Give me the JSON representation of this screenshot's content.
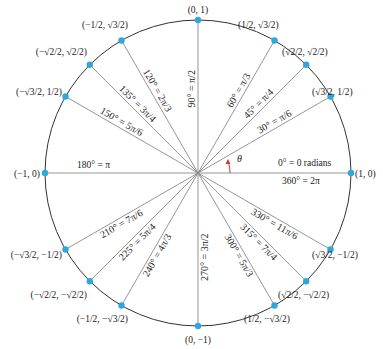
{
  "diagram": {
    "colors": {
      "point": "#2ea8dc",
      "theta_arrow": "#e0303a",
      "circle": "#333333",
      "rays": "#8a8a8a"
    },
    "center": [
      198,
      173
    ],
    "radius": 153,
    "theta_label": "θ",
    "axis_labels": {
      "right_top": "0° = 0 radians",
      "right_bottom": "360° = 2π",
      "left": "180° = π",
      "top": "90° = π/2",
      "bottom": "270° = 3π/2"
    },
    "angles": [
      {
        "deg": 0,
        "label": "",
        "coord": "(1, 0)"
      },
      {
        "deg": 30,
        "label": "30° = π/6",
        "coord": "(√3/2, 1/2)"
      },
      {
        "deg": 45,
        "label": "45° = π/4",
        "coord": "(√2/2, √2/2)"
      },
      {
        "deg": 60,
        "label": "60° = π/3",
        "coord": "(1/2, √3/2)"
      },
      {
        "deg": 90,
        "label": "90° = π/2",
        "coord": "(0, 1)"
      },
      {
        "deg": 120,
        "label": "120° = 2π/3",
        "coord": "(−1/2, √3/2)"
      },
      {
        "deg": 135,
        "label": "135° = 3π/4",
        "coord": "(−√2/2, √2/2)"
      },
      {
        "deg": 150,
        "label": "150° = 5π/6",
        "coord": "(−√3/2, 1/2)"
      },
      {
        "deg": 180,
        "label": "180° = π",
        "coord": "(−1, 0)"
      },
      {
        "deg": 210,
        "label": "210° = 7π/6",
        "coord": "(−√3/2, −1/2)"
      },
      {
        "deg": 225,
        "label": "225° = 5π/4",
        "coord": "(−√2/2, −√2/2)"
      },
      {
        "deg": 240,
        "label": "240° = 4π/3",
        "coord": "(−1/2, −√3/2)"
      },
      {
        "deg": 270,
        "label": "270° = 3π/2",
        "coord": "(0, −1)"
      },
      {
        "deg": 300,
        "label": "300° = 5π/3",
        "coord": "(1/2, −√3/2)"
      },
      {
        "deg": 315,
        "label": "315° = 7π/4",
        "coord": "(√2/2, −√2/2)"
      },
      {
        "deg": 330,
        "label": "330° = 11π/6",
        "coord": "(√3/2, −1/2)"
      }
    ]
  }
}
